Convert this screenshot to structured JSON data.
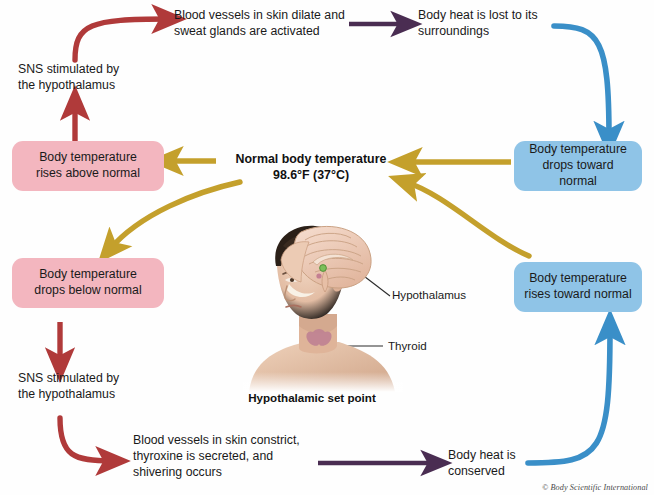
{
  "diagram": {
    "credit": "© Body Scientific International",
    "colors": {
      "pink_box": "#f3b6bf",
      "blue_box": "#8fc4e7",
      "red_arrow": "#b03a3a",
      "blue_arrow": "#3a8fc8",
      "gold_arrow": "#c4a02c",
      "purple_arrow": "#4a2d52",
      "text": "#1a1a1a"
    }
  },
  "center": {
    "line1": "Normal body temperature",
    "line2": "98.6°F (37°C)"
  },
  "illustration": {
    "caption": "Hypothalamic set point",
    "labels": [
      {
        "id": "hypothalamus",
        "text": "Hypothalamus"
      },
      {
        "id": "thyroid",
        "text": "Thyroid"
      }
    ]
  },
  "nodes": {
    "heat_loss_response": "Blood vessels in skin dilate and sweat glands are activated",
    "heat_lost": "Body heat is lost to its surroundings",
    "sns_top": "SNS stimulated by the hypothalamus",
    "temp_rises_above": "Body temperature rises above normal",
    "temp_drops_toward": "Body temperature drops toward normal",
    "temp_drops_below": "Body temperature drops below normal",
    "temp_rises_toward": "Body temperature rises toward normal",
    "sns_bottom": "SNS stimulated by the hypothalamus",
    "heat_conserve_response": "Blood vessels in skin constrict, thyroxine is secreted, and shivering occurs",
    "heat_conserved": "Body heat is conserved"
  },
  "node_lines": {
    "heat_loss_response": [
      "Blood vessels in skin dilate and",
      "sweat glands are activated"
    ],
    "heat_lost": [
      "Body heat is lost to its",
      "surroundings"
    ],
    "sns_top": [
      "SNS stimulated by",
      "the hypothalamus"
    ],
    "temp_rises_above": [
      "Body temperature",
      "rises above normal"
    ],
    "temp_drops_toward": [
      "Body temperature",
      "drops toward normal"
    ],
    "temp_drops_below": [
      "Body temperature",
      "drops below normal"
    ],
    "temp_rises_toward": [
      "Body temperature",
      "rises toward normal"
    ],
    "sns_bottom": [
      "SNS stimulated by",
      "the hypothalamus"
    ],
    "heat_conserve_response": [
      "Blood vessels in skin constrict,",
      "thyroxine is secreted, and",
      "shivering occurs"
    ],
    "heat_conserved": [
      "Body heat is",
      "conserved"
    ]
  }
}
